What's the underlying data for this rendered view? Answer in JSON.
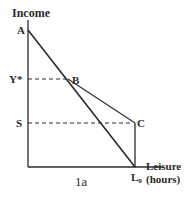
{
  "diagram": {
    "y_axis_label": "Income",
    "x_axis_label_line1": "Leisure",
    "x_axis_label_line2": "(hours)",
    "points": {
      "A": "A",
      "B": "B",
      "C": "C",
      "L0": "L",
      "L0_sub": "0"
    },
    "y_ticks": {
      "y_star": "Y*",
      "s": "S"
    },
    "bottom_caption": "1a",
    "colors": {
      "line": "#2a2a2a",
      "background": "#ffffff"
    }
  }
}
